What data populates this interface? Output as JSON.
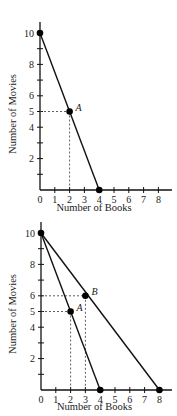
{
  "chart_data": [
    {
      "type": "line",
      "title": "",
      "xlabel": "Number of Books",
      "ylabel": "Number of Movies",
      "xlim": [
        0,
        8
      ],
      "ylim": [
        0,
        10
      ],
      "x_ticks": [
        "0",
        "1",
        "2",
        "3",
        "4",
        "5",
        "6",
        "7",
        "8"
      ],
      "y_ticks": [
        "2",
        "4",
        "5",
        "6",
        "8",
        "10"
      ],
      "grid": false,
      "series": [
        {
          "name": "PPF 1",
          "x": [
            0,
            4
          ],
          "y": [
            10,
            0
          ]
        }
      ],
      "points": [
        {
          "label": "A",
          "x": 2,
          "y": 5,
          "dashed_guides": true
        }
      ],
      "markers": [
        {
          "x": 0,
          "y": 10
        },
        {
          "x": 2,
          "y": 5
        },
        {
          "x": 4,
          "y": 0
        }
      ]
    },
    {
      "type": "line",
      "title": "",
      "xlabel": "Number of Books",
      "ylabel": "Number of Movies",
      "xlim": [
        0,
        8
      ],
      "ylim": [
        0,
        10
      ],
      "x_ticks": [
        "0",
        "1",
        "2",
        "3",
        "4",
        "5",
        "6",
        "7",
        "8"
      ],
      "y_ticks": [
        "2",
        "4",
        "5",
        "6",
        "8",
        "10"
      ],
      "grid": false,
      "series": [
        {
          "name": "PPF 1",
          "x": [
            0,
            4
          ],
          "y": [
            10,
            0
          ]
        },
        {
          "name": "PPF 2",
          "x": [
            0,
            8
          ],
          "y": [
            10,
            0
          ]
        }
      ],
      "points": [
        {
          "label": "A",
          "x": 2,
          "y": 5,
          "dashed_guides": true
        },
        {
          "label": "B",
          "x": 3,
          "y": 6,
          "dashed_guides": true
        }
      ],
      "markers": [
        {
          "x": 0,
          "y": 10
        },
        {
          "x": 2,
          "y": 5
        },
        {
          "x": 3,
          "y": 6
        },
        {
          "x": 4,
          "y": 0
        },
        {
          "x": 8,
          "y": 0
        }
      ]
    }
  ]
}
